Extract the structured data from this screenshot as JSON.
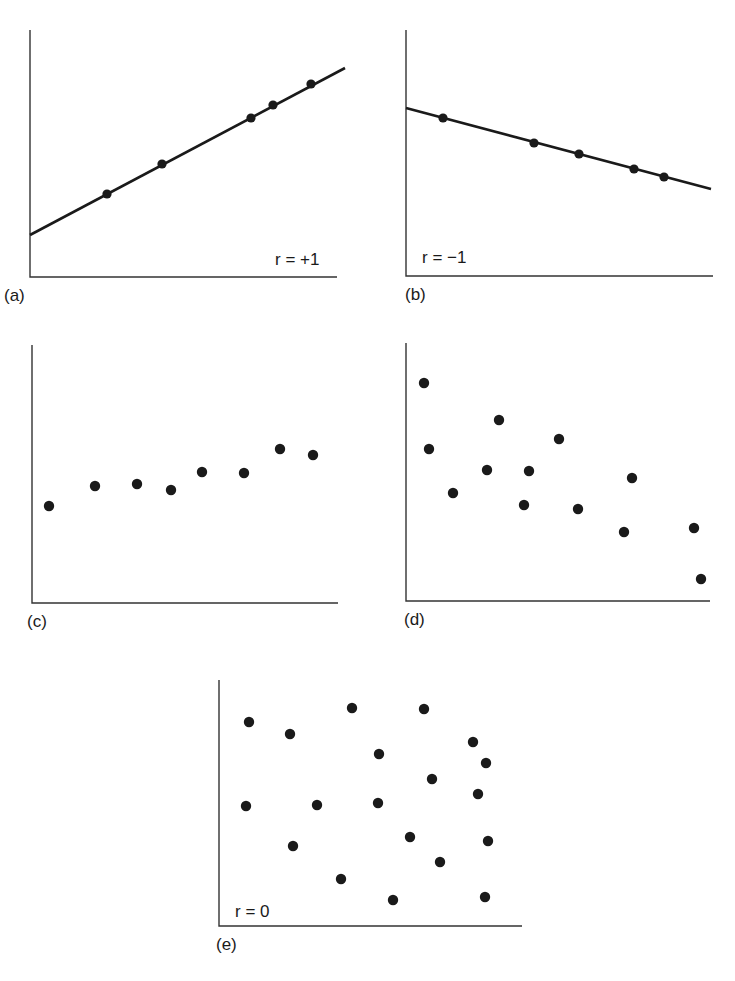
{
  "figure": {
    "panels": [
      {
        "id": "a",
        "label": "(a)",
        "annotation": "r = +1"
      },
      {
        "id": "b",
        "label": "(b)",
        "annotation": "r = −1"
      },
      {
        "id": "c",
        "label": "(c)",
        "annotation": ""
      },
      {
        "id": "d",
        "label": "(d)",
        "annotation": ""
      },
      {
        "id": "e",
        "label": "(e)",
        "annotation": "r = 0"
      }
    ]
  },
  "colors": {
    "ink": "#1a1a1a",
    "background": "#ffffff"
  },
  "chart_data": [
    {
      "type": "scatter",
      "panel": "(a)",
      "title": "",
      "annotation": "r = +1",
      "xlabel": "",
      "ylabel": "",
      "grid": false,
      "fit_line": true,
      "description": "Perfect positive correlation: all points lie on an upward-sloping line",
      "axes_px": {
        "x0": 30,
        "y0": 277,
        "x1": 337,
        "y1": 30
      },
      "line_px": [
        [
          30,
          235
        ],
        [
          345,
          68
        ]
      ],
      "points_px": [
        [
          107,
          194
        ],
        [
          162,
          164
        ],
        [
          251,
          118
        ],
        [
          273,
          105
        ],
        [
          311,
          84
        ]
      ]
    },
    {
      "type": "scatter",
      "panel": "(b)",
      "title": "",
      "annotation": "r = −1",
      "xlabel": "",
      "ylabel": "",
      "grid": false,
      "fit_line": true,
      "description": "Perfect negative correlation: all points lie on a downward-sloping line",
      "axes_px": {
        "x0": 406,
        "y0": 276,
        "x1": 713,
        "y1": 30
      },
      "line_px": [
        [
          406,
          108
        ],
        [
          711,
          189
        ]
      ],
      "points_px": [
        [
          443,
          118
        ],
        [
          534,
          143
        ],
        [
          579,
          154
        ],
        [
          634,
          169
        ],
        [
          664,
          177
        ]
      ]
    },
    {
      "type": "scatter",
      "panel": "(c)",
      "title": "",
      "annotation": "",
      "xlabel": "",
      "ylabel": "",
      "grid": false,
      "fit_line": false,
      "description": "Weak positive correlation",
      "axes_px": {
        "x0": 32,
        "y0": 603,
        "x1": 338,
        "y1": 345
      },
      "points_px": [
        [
          49,
          506
        ],
        [
          95,
          486
        ],
        [
          137,
          484
        ],
        [
          171,
          490
        ],
        [
          202,
          472
        ],
        [
          244,
          473
        ],
        [
          280,
          449
        ],
        [
          313,
          455
        ]
      ]
    },
    {
      "type": "scatter",
      "panel": "(d)",
      "title": "",
      "annotation": "",
      "xlabel": "",
      "ylabel": "",
      "grid": false,
      "fit_line": false,
      "description": "Moderate negative correlation",
      "axes_px": {
        "x0": 406,
        "y0": 601,
        "x1": 710,
        "y1": 343
      },
      "points_px": [
        [
          424,
          383
        ],
        [
          429,
          449
        ],
        [
          453,
          493
        ],
        [
          487,
          470
        ],
        [
          499,
          420
        ],
        [
          524,
          505
        ],
        [
          529,
          471
        ],
        [
          559,
          439
        ],
        [
          578,
          509
        ],
        [
          624,
          532
        ],
        [
          632,
          478
        ],
        [
          694,
          528
        ],
        [
          701,
          579
        ]
      ]
    },
    {
      "type": "scatter",
      "panel": "(e)",
      "title": "",
      "annotation": "r = 0",
      "xlabel": "",
      "ylabel": "",
      "grid": false,
      "fit_line": false,
      "description": "No correlation",
      "axes_px": {
        "x0": 219,
        "y0": 926,
        "x1": 522,
        "y1": 680
      },
      "points_px": [
        [
          249,
          722
        ],
        [
          290,
          734
        ],
        [
          352,
          708
        ],
        [
          424,
          709
        ],
        [
          379,
          754
        ],
        [
          473,
          742
        ],
        [
          486,
          763
        ],
        [
          432,
          779
        ],
        [
          246,
          806
        ],
        [
          317,
          805
        ],
        [
          378,
          803
        ],
        [
          478,
          794
        ],
        [
          293,
          846
        ],
        [
          410,
          837
        ],
        [
          488,
          841
        ],
        [
          440,
          862
        ],
        [
          341,
          879
        ],
        [
          393,
          900
        ],
        [
          485,
          897
        ]
      ]
    }
  ]
}
